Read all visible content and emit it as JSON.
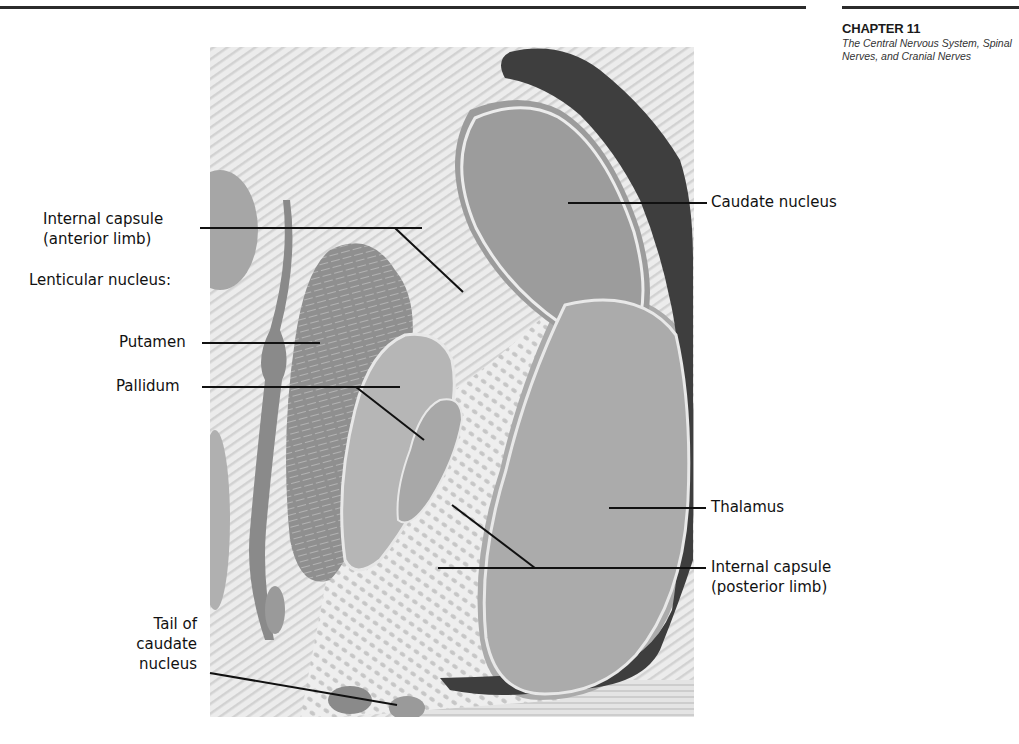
{
  "header": {
    "chapter": "CHAPTER 11",
    "chapter_title": "The Central Nervous System, Spinal Nerves, and Cranial Nerves"
  },
  "figure": {
    "colors": {
      "background_fibers": "#e6e6e6",
      "caudate": "#9a9a9a",
      "ventricle": "#3c3c3c",
      "putamen": "#8e8e8e",
      "pallidum": "#b4b4b4",
      "thalamus": "#a8a8a8",
      "leader_line": "#111111"
    },
    "labels": {
      "internal_capsule_anterior_1": "Internal capsule",
      "internal_capsule_anterior_2": "(anterior limb)",
      "lenticular_nucleus": "Lenticular nucleus:",
      "putamen": "Putamen",
      "pallidum": "Pallidum",
      "tail_caudate_1": "Tail of",
      "tail_caudate_2": "caudate",
      "tail_caudate_3": "nucleus",
      "caudate_nucleus": "Caudate nucleus",
      "thalamus": "Thalamus",
      "internal_capsule_posterior_1": "Internal capsule",
      "internal_capsule_posterior_2": "(posterior limb)"
    }
  }
}
